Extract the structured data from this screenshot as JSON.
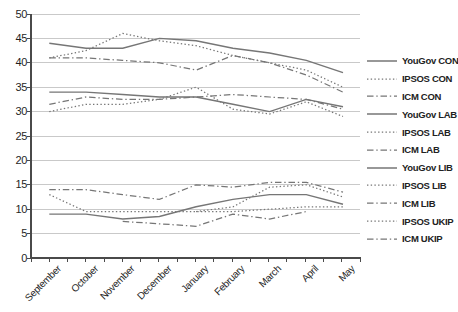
{
  "chart_data": {
    "type": "line",
    "title": "",
    "categories": [
      "September",
      "October",
      "November",
      "December",
      "January",
      "February",
      "March",
      "April",
      "May"
    ],
    "ylim": [
      0,
      50
    ],
    "ytick_step": 5,
    "grid": true,
    "legend_position": "right",
    "series": [
      {
        "name": "YouGov CON",
        "style": "solid",
        "values": [
          44,
          43,
          43,
          45,
          44.5,
          43,
          42,
          40.5,
          38
        ]
      },
      {
        "name": "IPSOS CON",
        "style": "dotted",
        "values": [
          41,
          42.5,
          46,
          44.5,
          43.5,
          41.5,
          40,
          38.5,
          35
        ]
      },
      {
        "name": "ICM CON",
        "style": "dashdot",
        "values": [
          41,
          41,
          40.5,
          40,
          38.5,
          41.5,
          40,
          37.5,
          34
        ]
      },
      {
        "name": "YouGov LAB",
        "style": "solid",
        "values": [
          34,
          34,
          33.5,
          33,
          33,
          31.5,
          30,
          32.5,
          31
        ]
      },
      {
        "name": "IPSOS LAB",
        "style": "dotted",
        "values": [
          30,
          31.5,
          31.5,
          32.5,
          35,
          30.5,
          29.5,
          32,
          29
        ]
      },
      {
        "name": "ICM LAB",
        "style": "dashdot",
        "values": [
          31.5,
          33,
          32.5,
          32.5,
          33,
          33.5,
          33,
          32.5,
          30.5
        ]
      },
      {
        "name": "YouGov LIB",
        "style": "solid",
        "values": [
          9,
          9,
          8,
          8.5,
          10.5,
          12,
          13,
          13,
          11
        ]
      },
      {
        "name": "IPSOS LIB",
        "style": "dotted",
        "values": [
          13,
          9.5,
          9.5,
          9.5,
          9.5,
          9.5,
          10,
          10.5,
          10.5
        ]
      },
      {
        "name": "ICM LIB",
        "style": "dashdot",
        "values": [
          14,
          14,
          13,
          12,
          15,
          14.5,
          15.5,
          15.5,
          13.5
        ]
      },
      {
        "name": "IPSOS UKIP",
        "style": "dotted",
        "values": [
          null,
          null,
          null,
          null,
          9.5,
          10.5,
          14.5,
          15,
          12.5
        ]
      },
      {
        "name": "ICM UKIP",
        "style": "dashdot",
        "values": [
          null,
          null,
          7.5,
          7,
          6.5,
          9,
          8,
          9.5,
          null
        ]
      }
    ],
    "colors": {
      "line": "#767676",
      "grid": "#c9c9c9",
      "axis": "#4a4a4a",
      "text": "#1f1f1f"
    }
  }
}
